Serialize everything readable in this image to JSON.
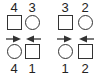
{
  "groups": [
    {
      "top_labels": [
        "4",
        "3"
      ],
      "top_shapes": [
        "square",
        "circle"
      ],
      "arrows": [
        "right",
        "left"
      ],
      "bottom_shapes": [
        "circle",
        "square"
      ],
      "bottom_labels": [
        "4",
        "1"
      ]
    },
    {
      "top_labels": [
        "3",
        "2"
      ],
      "top_shapes": [
        "square",
        "circle"
      ],
      "arrows": [
        "right",
        "left"
      ],
      "bottom_shapes": [
        "circle",
        "square"
      ],
      "bottom_labels": [
        "1",
        "2"
      ]
    }
  ],
  "colors": {
    "stroke": "#333333",
    "text": "#222222",
    "background": "#ffffff"
  }
}
